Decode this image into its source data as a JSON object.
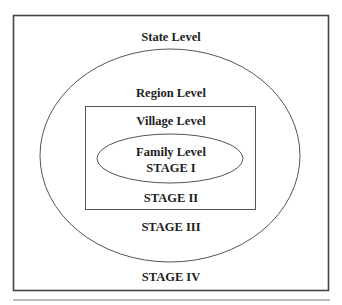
{
  "diagram": {
    "type": "nested-levels",
    "colors": {
      "line": "#555555",
      "outer_box": "#444444",
      "text": "#1e1e1e",
      "background": "#ffffff"
    },
    "levels": [
      {
        "name": "State Level",
        "stage": "STAGE IV",
        "shape": "rectangle"
      },
      {
        "name": "Region Level",
        "stage": "STAGE III",
        "shape": "ellipse"
      },
      {
        "name": "Village Level",
        "stage": "STAGE II",
        "shape": "rectangle"
      },
      {
        "name": "Family Level",
        "stage": "STAGE I",
        "shape": "ellipse"
      }
    ],
    "labels": {
      "state": "State Level",
      "region": "Region Level",
      "village": "Village Level",
      "family": "Family Level",
      "stage_1": "STAGE I",
      "stage_2": "STAGE II",
      "stage_3": "STAGE III",
      "stage_4": "STAGE IV"
    }
  }
}
